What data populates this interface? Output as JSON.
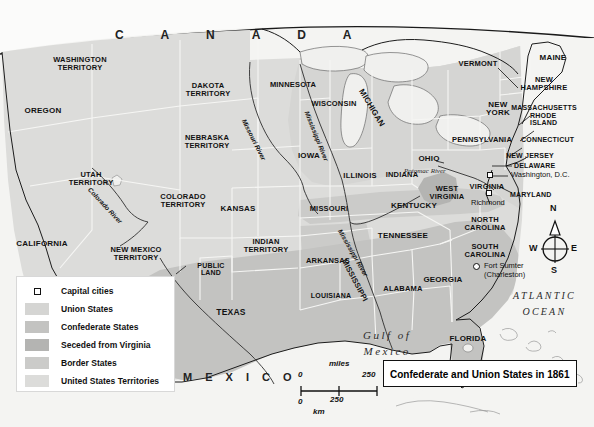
{
  "title": {
    "text": "Confederate and Union States in 1861"
  },
  "neighbors": {
    "canada": "C A N A D A",
    "mexico": "M E X I C O"
  },
  "water_labels": [
    {
      "name": "gulf-of-mexico",
      "text": "Gulf of\nMexico"
    },
    {
      "name": "atlantic-ocean",
      "text": "ATLANTIC\nOCEAN"
    }
  ],
  "rivers": [
    {
      "name": "colorado-river",
      "text": "Colorado River"
    },
    {
      "name": "missouri-river",
      "text": "Missouri River"
    },
    {
      "name": "mississippi-river-north",
      "text": "Mississippi River"
    },
    {
      "name": "mississippi-river-south",
      "text": "Mississippi River"
    },
    {
      "name": "potomac-river",
      "text": "Potomac River"
    }
  ],
  "states": [
    {
      "name": "washington-territory",
      "text": "WASHINGTON\nTERRITORY"
    },
    {
      "name": "oregon",
      "text": "OREGON"
    },
    {
      "name": "utah-territory",
      "text": "UTAH\nTERRITORY"
    },
    {
      "name": "california",
      "text": "CALIFORNIA"
    },
    {
      "name": "new-mexico-territory",
      "text": "NEW MEXICO\nTERRITORY"
    },
    {
      "name": "dakota-territory",
      "text": "DAKOTA\nTERRITORY"
    },
    {
      "name": "nebraska-territory",
      "text": "NEBRASKA\nTERRITORY"
    },
    {
      "name": "colorado-territory",
      "text": "COLORADO\nTERRITORY"
    },
    {
      "name": "kansas",
      "text": "KANSAS"
    },
    {
      "name": "public-land",
      "text": "PUBLIC\nLAND"
    },
    {
      "name": "indian-territory",
      "text": "INDIAN\nTERRITORY"
    },
    {
      "name": "texas",
      "text": "TEXAS"
    },
    {
      "name": "minnesota",
      "text": "MINNESOTA"
    },
    {
      "name": "wisconsin",
      "text": "WISCONSIN"
    },
    {
      "name": "iowa",
      "text": "IOWA"
    },
    {
      "name": "missouri",
      "text": "MISSOURI"
    },
    {
      "name": "arkansas",
      "text": "ARKANSAS"
    },
    {
      "name": "louisiana",
      "text": "LOUISIANA"
    },
    {
      "name": "mississippi",
      "text": "MISSISSIPPI"
    },
    {
      "name": "alabama",
      "text": "ALABAMA"
    },
    {
      "name": "illinois",
      "text": "ILLINOIS"
    },
    {
      "name": "indiana",
      "text": "INDIANA"
    },
    {
      "name": "michigan",
      "text": "MICHIGAN"
    },
    {
      "name": "ohio",
      "text": "OHIO"
    },
    {
      "name": "kentucky",
      "text": "KENTUCKY"
    },
    {
      "name": "tennessee",
      "text": "TENNESSEE"
    },
    {
      "name": "georgia",
      "text": "GEORGIA"
    },
    {
      "name": "florida",
      "text": "FLORIDA"
    },
    {
      "name": "south-carolina",
      "text": "SOUTH\nCAROLINA"
    },
    {
      "name": "north-carolina",
      "text": "NORTH\nCAROLINA"
    },
    {
      "name": "virginia",
      "text": "VIRGINIA"
    },
    {
      "name": "west-virginia",
      "text": "WEST\nVIRGINIA"
    },
    {
      "name": "maryland",
      "text": "MARYLAND"
    },
    {
      "name": "delaware",
      "text": "DELAWARE"
    },
    {
      "name": "new-jersey",
      "text": "NEW JERSEY"
    },
    {
      "name": "pennsylvania",
      "text": "PENNSYLVANIA"
    },
    {
      "name": "new-york",
      "text": "NEW\nYORK"
    },
    {
      "name": "connecticut",
      "text": "CONNECTICUT"
    },
    {
      "name": "rhode-island",
      "text": "RHODE\nISLAND"
    },
    {
      "name": "massachusetts",
      "text": "MASSACHUSETTS"
    },
    {
      "name": "vermont",
      "text": "VERMONT"
    },
    {
      "name": "new-hampshire",
      "text": "NEW\nHAMPSHIRE"
    },
    {
      "name": "maine",
      "text": "MAINE"
    }
  ],
  "points": [
    {
      "name": "washington-dc",
      "text": "Washington, D.C.",
      "marker": "square"
    },
    {
      "name": "richmond",
      "text": "Richmond",
      "marker": "square"
    },
    {
      "name": "fort-sumter",
      "text": "Fort Sumter\n(Charleston)",
      "marker": "circle"
    }
  ],
  "legend": {
    "items": [
      {
        "name": "capital-cities",
        "label": "Capital cities",
        "swatch": "marker"
      },
      {
        "name": "union-states",
        "label": "Union States",
        "swatch": "#d5d5d3"
      },
      {
        "name": "confederate-states",
        "label": "Confederate States",
        "swatch": "#c3c3c1"
      },
      {
        "name": "seceded-from-virginia",
        "label": "Seceded from Virginia",
        "swatch": "#b4b4b2"
      },
      {
        "name": "border-states",
        "label": "Border States",
        "swatch": "#cbcbc9"
      },
      {
        "name": "united-states-territories",
        "label": "United States Territories",
        "swatch": "#dcdcda"
      }
    ]
  },
  "scale": {
    "miles_label": "miles",
    "km_label": "km",
    "miles_zero": "0",
    "miles_max": "250",
    "km_zero": "0",
    "km_max": "250"
  },
  "compass": {
    "north": "N",
    "south": "S",
    "east": "E",
    "west": "W"
  }
}
